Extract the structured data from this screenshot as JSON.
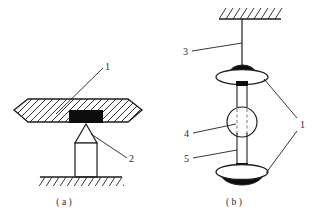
{
  "figure": {
    "type": "technical-line-diagram",
    "panels": [
      {
        "id": "a",
        "caption": "( a )",
        "description": "hatched lens-shaped plate supported on a pointed column standing on hatched ground",
        "callouts": [
          {
            "id": "1",
            "label": "1",
            "target": "hatched-plate"
          },
          {
            "id": "2",
            "label": "2",
            "target": "pointed-support-tip"
          }
        ]
      },
      {
        "id": "b",
        "caption": "( b )",
        "description": "vertical rod hung from hatched ceiling carrying two mushroom discs and a central sphere",
        "callouts": [
          {
            "id": "3",
            "label": "3",
            "target": "suspension-rod"
          },
          {
            "id": "4",
            "label": "4",
            "target": "central-sphere"
          },
          {
            "id": "5",
            "label": "5",
            "target": "lower-shaft"
          },
          {
            "id": "1",
            "label": "1",
            "target": "upper-and-lower-discs"
          }
        ]
      }
    ],
    "colors": {
      "stroke": "#1f1f1f",
      "fill_black": "#0d0d0d",
      "fill_white": "#ffffff",
      "background": "#ffffff"
    }
  }
}
